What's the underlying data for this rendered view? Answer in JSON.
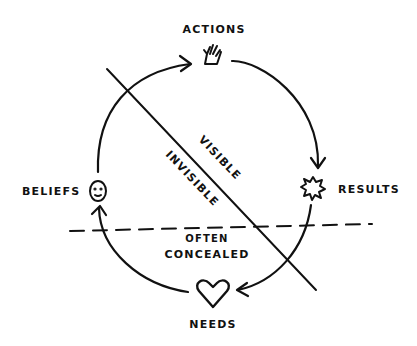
{
  "diagram": {
    "type": "cycle",
    "nodes": [
      {
        "id": "actions",
        "label": "ACTIONS",
        "icon": "hand-icon"
      },
      {
        "id": "results",
        "label": "RESULTS",
        "icon": "starburst-icon"
      },
      {
        "id": "needs",
        "label": "NEEDS",
        "icon": "heart-icon"
      },
      {
        "id": "beliefs",
        "label": "BELIEFS",
        "icon": "smiley-face-icon"
      }
    ],
    "edges": [
      {
        "from": "actions",
        "to": "results"
      },
      {
        "from": "results",
        "to": "needs"
      },
      {
        "from": "needs",
        "to": "beliefs"
      },
      {
        "from": "beliefs",
        "to": "actions"
      }
    ],
    "divider_labels": {
      "visible": "VISIBLE",
      "invisible": "INVISIBLE",
      "concealed_line1": "OFTEN",
      "concealed_line2": "CONCEALED"
    },
    "stroke_color": "#111111",
    "background": "#ffffff"
  }
}
